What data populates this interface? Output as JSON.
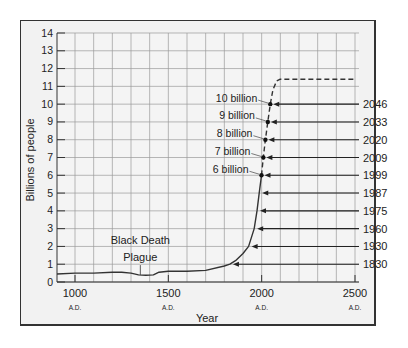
{
  "chart_data": {
    "type": "line",
    "title": "",
    "xlabel": "Year",
    "ylabel": "Billions of people",
    "xlim": [
      900,
      2500
    ],
    "ylim": [
      0,
      14
    ],
    "grid": true,
    "x_ticks": [
      {
        "value": 1000,
        "label": "1000",
        "sub": "A.D."
      },
      {
        "value": 1500,
        "label": "1500",
        "sub": "A.D."
      },
      {
        "value": 2000,
        "label": "2000",
        "sub": "A.D."
      },
      {
        "value": 2500,
        "label": "2500",
        "sub": "A.D."
      }
    ],
    "y_ticks": [
      0,
      1,
      2,
      3,
      4,
      5,
      6,
      7,
      8,
      9,
      10,
      11,
      12,
      13,
      14
    ],
    "series": [
      {
        "name": "World population (historical)",
        "style": "solid",
        "x": [
          900,
          1000,
          1100,
          1200,
          1250,
          1300,
          1340,
          1380,
          1420,
          1450,
          1500,
          1600,
          1700,
          1800,
          1830,
          1860,
          1900,
          1930,
          1960,
          1975,
          1987,
          1999
        ],
        "y": [
          0.45,
          0.5,
          0.5,
          0.55,
          0.55,
          0.5,
          0.4,
          0.38,
          0.4,
          0.55,
          0.6,
          0.6,
          0.65,
          0.9,
          1.0,
          1.2,
          1.6,
          2.0,
          3.0,
          4.0,
          5.0,
          6.0
        ]
      },
      {
        "name": "Projected population",
        "style": "dashed",
        "x": [
          1999,
          2009,
          2020,
          2033,
          2046,
          2060,
          2080,
          2100,
          2500
        ],
        "y": [
          6.0,
          7.0,
          8.0,
          9.0,
          10.0,
          10.8,
          11.3,
          11.4,
          11.4
        ]
      }
    ],
    "milestones": [
      {
        "population": 1,
        "year": "1830",
        "label": ""
      },
      {
        "population": 2,
        "year": "1930",
        "label": ""
      },
      {
        "population": 3,
        "year": "1960",
        "label": ""
      },
      {
        "population": 4,
        "year": "1975",
        "label": ""
      },
      {
        "population": 5,
        "year": "1987",
        "label": ""
      },
      {
        "population": 6,
        "year": "1999",
        "label": "6 billion"
      },
      {
        "population": 7,
        "year": "2009",
        "label": "7 billion"
      },
      {
        "population": 8,
        "year": "2020",
        "label": "8 billion"
      },
      {
        "population": 9,
        "year": "2033",
        "label": "9 billion"
      },
      {
        "population": 10,
        "year": "2046",
        "label": "10 billion"
      }
    ],
    "annotations": [
      {
        "text": "Black Death",
        "line2": "Plague",
        "x": 1350,
        "y": 0.4
      }
    ]
  },
  "labels": {
    "x_axis": "Year",
    "y_axis": "Billions of people",
    "annotation_line1": "Black Death",
    "annotation_line2": "Plague"
  },
  "colors": {
    "background": "#f2f2f2",
    "grid": "#9a9a9a",
    "line": "#333333",
    "frame": "#333333"
  }
}
